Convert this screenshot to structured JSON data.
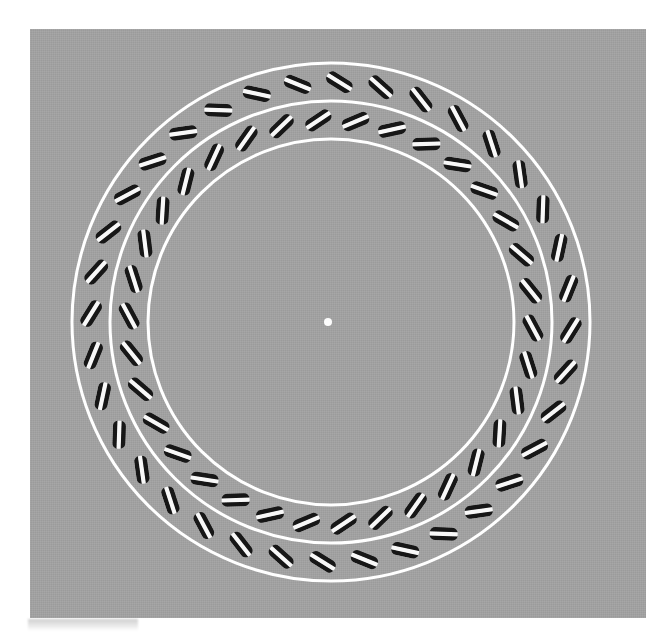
{
  "figure": {
    "canvas": {
      "width": 666,
      "height": 633,
      "background_color": "#ffffff"
    },
    "panel": {
      "name": "stimulus-panel",
      "left": 30,
      "top": 29,
      "width": 616,
      "height": 589,
      "background_color": "#a0a0a0",
      "texture": "halftone print grain"
    },
    "center": {
      "x": 331,
      "y": 322
    },
    "fixation_dot": {
      "label": "central fixation point",
      "radius": 4,
      "color": "#fdfdfd",
      "cx": 328,
      "cy": 322
    },
    "guide_circles": {
      "color": "#ffffff",
      "stroke_width": 3,
      "radii": [
        183,
        221,
        259
      ],
      "labels": [
        "inner boundary",
        "middle boundary",
        "outer boundary"
      ]
    },
    "element_style": {
      "length": 28,
      "width": 13,
      "corner_radius": 5.5,
      "band_colors": [
        "#161616",
        "#f8f8f8",
        "#161616"
      ],
      "band_fractions": [
        0.34,
        0.32,
        0.34
      ],
      "description": "rounded bar with black-white-black stripes across its long axis"
    },
    "rings": [
      {
        "name": "outer-ring",
        "radius": 240,
        "count": 36,
        "start_angle_deg": -88,
        "tilt_from_tangent_deg": 30,
        "tilt_sense": "clockwise",
        "element_count_label": "36 elements"
      },
      {
        "name": "inner-ring",
        "radius": 202,
        "count": 34,
        "start_angle_deg": -83,
        "tilt_from_tangent_deg": -30,
        "tilt_sense": "counter-clockwise",
        "element_count_label": "34 elements"
      }
    ],
    "smudge": {
      "label": "scan artifact smudge",
      "left": 28,
      "top": 619,
      "width": 110,
      "height": 12
    }
  }
}
